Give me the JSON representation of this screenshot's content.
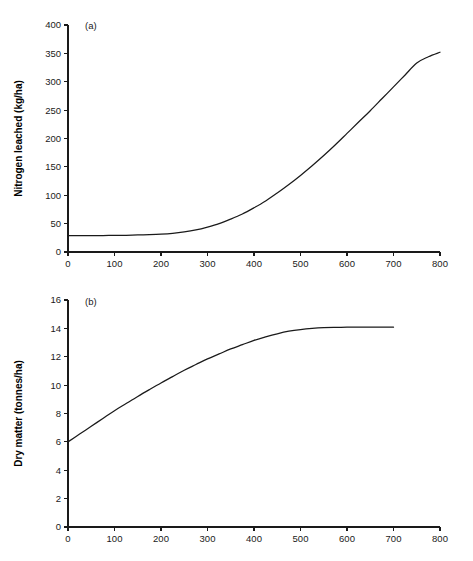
{
  "figure": {
    "background_color": "#ffffff",
    "ink_color": "#1a1a1a"
  },
  "chart_data": [
    {
      "type": "line",
      "panel_tag": "(a)",
      "title": "",
      "xlabel": "",
      "ylabel": "Nitrogen leached (kg/ha)",
      "xlim": [
        0,
        800
      ],
      "ylim": [
        0,
        400
      ],
      "xticks": [
        0,
        100,
        200,
        300,
        400,
        500,
        600,
        700,
        800
      ],
      "xticklabels": [
        "0",
        "100",
        "200",
        "300",
        "400",
        "500",
        "600",
        "700",
        "800"
      ],
      "yticks": [
        0,
        50,
        100,
        150,
        200,
        250,
        300,
        350,
        400
      ],
      "yticklabels": [
        "0",
        "50",
        "100",
        "150",
        "200",
        "250",
        "300",
        "350",
        "400"
      ],
      "grid": false,
      "legend": false,
      "line_color": "#1a1a1a",
      "x": [
        0,
        25,
        50,
        75,
        100,
        125,
        150,
        175,
        200,
        225,
        250,
        275,
        300,
        325,
        350,
        375,
        400,
        425,
        450,
        475,
        500,
        525,
        550,
        575,
        600,
        625,
        650,
        675,
        700,
        725,
        750,
        775,
        800
      ],
      "y": [
        29,
        29,
        29,
        29,
        29.2,
        29.5,
        30,
        30.6,
        31.5,
        33,
        35.5,
        39,
        44,
        50,
        58,
        67,
        78,
        90,
        104,
        119,
        135,
        152,
        170,
        189,
        209,
        229,
        249,
        270,
        291,
        312,
        333,
        344,
        352
      ]
    },
    {
      "type": "line",
      "panel_tag": "(b)",
      "title": "",
      "xlabel": "",
      "ylabel": "Dry matter (tonnes/ha)",
      "xlim": [
        0,
        800
      ],
      "ylim": [
        0,
        16
      ],
      "xticks": [
        0,
        100,
        200,
        300,
        400,
        500,
        600,
        700,
        800
      ],
      "xticklabels": [
        "0",
        "100",
        "200",
        "300",
        "400",
        "500",
        "600",
        "700",
        "800"
      ],
      "yticks": [
        0,
        2,
        4,
        6,
        8,
        10,
        12,
        14,
        16
      ],
      "yticklabels": [
        "0",
        "2",
        "4",
        "6",
        "8",
        "10",
        "12",
        "14",
        "16"
      ],
      "grid": false,
      "legend": false,
      "line_color": "#1a1a1a",
      "x": [
        0,
        25,
        50,
        75,
        100,
        125,
        150,
        175,
        200,
        225,
        250,
        275,
        300,
        325,
        350,
        375,
        400,
        425,
        450,
        475,
        500,
        525,
        550,
        575,
        600,
        625,
        650,
        675,
        700
      ],
      "y": [
        6.0,
        6.55,
        7.1,
        7.65,
        8.2,
        8.7,
        9.2,
        9.68,
        10.15,
        10.6,
        11.05,
        11.45,
        11.85,
        12.2,
        12.55,
        12.85,
        13.15,
        13.4,
        13.62,
        13.8,
        13.92,
        14.0,
        14.05,
        14.07,
        14.08,
        14.08,
        14.08,
        14.08,
        14.08
      ]
    }
  ]
}
